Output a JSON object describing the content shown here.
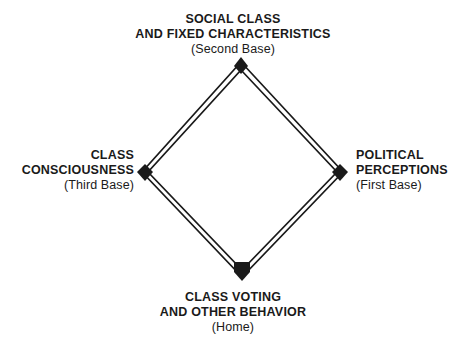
{
  "figure": {
    "type": "diagram",
    "shape": "baseball-diamond",
    "background_color": "#ffffff",
    "line_color": "#1a1a1a",
    "text_color": "#1a1a1a",
    "edge_style": "double-parallel-line",
    "vertices": [
      {
        "id": "second-base",
        "x": 241,
        "y": 65,
        "marker": "filled-diamond"
      },
      {
        "id": "first-base",
        "x": 340,
        "y": 172,
        "marker": "filled-diamond"
      },
      {
        "id": "home",
        "x": 242,
        "y": 274,
        "marker": "filled-home-plate"
      },
      {
        "id": "third-base",
        "x": 145,
        "y": 172,
        "marker": "filled-diamond"
      }
    ]
  },
  "labels": {
    "second_base": {
      "line1": "SOCIAL CLASS",
      "line2": "AND FIXED CHARACTERISTICS",
      "base": "(Second Base)"
    },
    "third_base": {
      "line1": "CLASS",
      "line2": "CONSCIOUSNESS",
      "base": "(Third Base)"
    },
    "first_base": {
      "line1": "POLITICAL",
      "line2": "PERCEPTIONS",
      "base": "(First Base)"
    },
    "home": {
      "line1": "CLASS VOTING",
      "line2": "AND OTHER BEHAVIOR",
      "base": "(Home)"
    }
  }
}
